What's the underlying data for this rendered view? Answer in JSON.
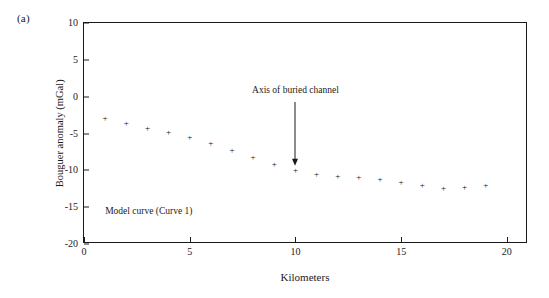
{
  "figure": {
    "panel_label": "(a)"
  },
  "chart_data": {
    "type": "scatter",
    "title": "",
    "xlabel": "Kilometers",
    "ylabel": "Bouguer anomaly (mGal)",
    "xlim": [
      0,
      21
    ],
    "ylim": [
      -20,
      10
    ],
    "xticks": [
      0,
      5,
      10,
      15,
      20
    ],
    "xtick_labels": [
      "0",
      "5",
      "10",
      "15",
      "20"
    ],
    "yticks": [
      10,
      5,
      0,
      -5,
      -10,
      -15,
      -20
    ],
    "ytick_labels": [
      "10",
      "5",
      "0",
      "-5",
      "-10",
      "-15",
      "-20"
    ],
    "grid": false,
    "legend_position": "none",
    "marker": "plus",
    "series": [
      {
        "name": "Model curve (Curve 1)",
        "x": [
          1,
          2,
          3,
          4,
          5,
          6,
          7,
          8,
          9,
          10,
          11,
          12,
          13,
          14,
          15,
          16,
          17,
          18,
          19
        ],
        "values": [
          -3.0,
          -3.7,
          -4.3,
          -4.9,
          -5.6,
          -6.4,
          -7.3,
          -8.2,
          -9.2,
          -10.0,
          -10.5,
          -10.8,
          -11.0,
          -11.3,
          -11.7,
          -12.0,
          -12.4,
          -12.3,
          -12.0
        ]
      }
    ],
    "annotations": [
      {
        "text": "Axis of buried channel",
        "x": 10,
        "y": 0.6,
        "arrow_to_x": 10,
        "arrow_to_y": -9.4
      },
      {
        "text": "Model curve (Curve 1)",
        "x": 1.0,
        "y": -15.6
      }
    ]
  }
}
